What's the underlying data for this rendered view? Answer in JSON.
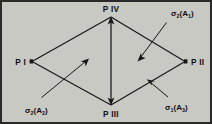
{
  "figure": {
    "background_color": "#c9c9c4",
    "ink_color": "#161616",
    "vertices": {
      "left": "P I",
      "right": "P II",
      "bottom": "P III",
      "top": "P IV"
    },
    "annotations": {
      "top_right": {
        "symbol": "σ",
        "sub": "2",
        "arg_letter": "A",
        "arg_sub": "1",
        "full": "σ₂(A₁)"
      },
      "bottom_left": {
        "symbol": "σ",
        "sub": "2",
        "arg_letter": "A",
        "arg_sub": "2",
        "full": "σ₂(A₂)"
      },
      "bottom_right": {
        "symbol": "σ",
        "sub": "1",
        "arg_letter": "A",
        "arg_sub": "3",
        "full": "σ₁(A₃)"
      }
    },
    "parens": {
      "open": "(",
      "close": ")"
    }
  }
}
